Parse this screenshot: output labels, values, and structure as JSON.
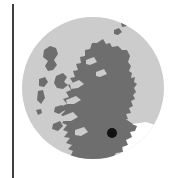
{
  "figure": {
    "name": "scotland-locator-map",
    "type": "locator-map",
    "width": 177,
    "height": 178,
    "background_color": "#ffffff"
  },
  "rule": {
    "name": "left-vertical-rule",
    "color": "#3f3f3f",
    "x": 12,
    "y_top": 4,
    "y_bottom": 178,
    "thickness": 2
  },
  "map": {
    "region_label": "Scotland",
    "disc": {
      "center_x": 93,
      "center_y": 88,
      "radius": 71,
      "fill_color": "#cccccc"
    },
    "land": {
      "fill_color": "#6e6e6e",
      "description": "Scotland mainland with Hebrides, Orkney and Shetland island groups"
    },
    "sea": {
      "fill_color": "#ffffff"
    },
    "marker": {
      "name": "location-marker-dot",
      "shape": "circle",
      "fill_color": "#111111",
      "center_x": 112,
      "center_y": 133,
      "radius": 5
    }
  },
  "chart_data": {
    "type": "map",
    "title": "",
    "xlabel": "",
    "ylabel": "",
    "projection": "plate-carree",
    "grid": false,
    "legend": "none",
    "series": [
      {
        "name": "Scotland landmass",
        "color": "#6e6e6e",
        "values": []
      },
      {
        "name": "Location marker",
        "color": "#111111",
        "values": [
          {
            "label": "marker",
            "x": 112,
            "y": 133
          }
        ]
      }
    ],
    "annotations": []
  }
}
